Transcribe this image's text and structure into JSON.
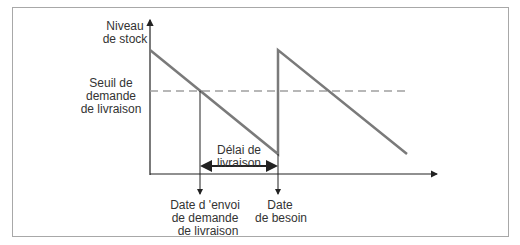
{
  "diagram": {
    "y_axis_label_line1": "Niveau",
    "y_axis_label_line2": "de stock",
    "threshold_label_line1": "Seuil de",
    "threshold_label_line2": "demande",
    "threshold_label_line3": "de livraison",
    "lead_time_label_line1": "Délai de",
    "lead_time_label_line2": "livraison",
    "order_date_label_line1": "Date d 'envoi",
    "order_date_label_line2": "de demande",
    "order_date_label_line3": "de livraison",
    "need_date_label_line1": "Date",
    "need_date_label_line2": "de besoin"
  },
  "colors": {
    "stock_line": "#7a7a7a",
    "threshold_line": "#a0a0a0",
    "axis": "#222222",
    "text": "#333333",
    "frame": "#a8a8a8"
  }
}
